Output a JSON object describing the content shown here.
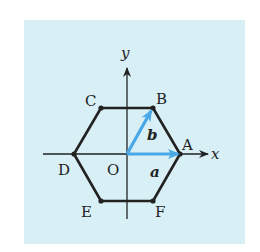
{
  "figure": {
    "background_color": "#d8eff6",
    "hexagon_color": "#222222",
    "vector_color": "#4aa8e6",
    "axes": {
      "x_label": "x",
      "y_label": "y"
    },
    "origin_label": "O",
    "vertices": [
      {
        "name": "A",
        "x": 180,
        "y": 154
      },
      {
        "name": "B",
        "x": 153,
        "y": 108
      },
      {
        "name": "C",
        "x": 101,
        "y": 108
      },
      {
        "name": "D",
        "x": 74,
        "y": 154
      },
      {
        "name": "E",
        "x": 101,
        "y": 201
      },
      {
        "name": "F",
        "x": 153,
        "y": 201
      }
    ],
    "vectors": [
      {
        "name": "a",
        "from": "O",
        "to": "A"
      },
      {
        "name": "b",
        "from": "O",
        "to": "B"
      }
    ]
  }
}
